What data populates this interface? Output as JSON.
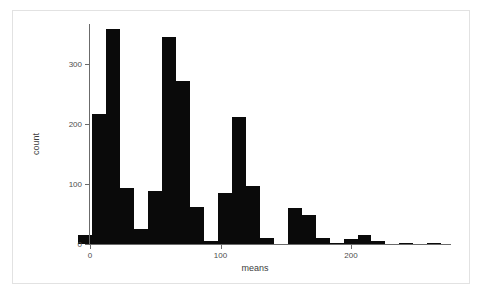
{
  "figure": {
    "background_color": "#ffffff",
    "frame_color": "#e2e2e2",
    "bar_color": "#0a0a0a",
    "axis_color": "#6b6b6b"
  },
  "axes": {
    "x_title": "means",
    "y_title": "count",
    "x_ticks": [
      "0",
      "100",
      "200"
    ],
    "y_ticks": [
      "0",
      "100",
      "200",
      "300"
    ]
  },
  "chart_data": {
    "type": "bar",
    "title": "",
    "subtitle": "",
    "xlabel": "means",
    "ylabel": "count",
    "xlim": [
      -9,
      277
    ],
    "ylim": [
      0,
      368
    ],
    "grid": false,
    "legend": null,
    "bin_width": 10.7,
    "bin_starts": [
      -9.0,
      1.7,
      12.4,
      23.1,
      33.8,
      44.5,
      55.2,
      65.9,
      76.6,
      87.3,
      98.0,
      108.7,
      119.4,
      130.1,
      140.8,
      151.5,
      162.2,
      172.9,
      183.6,
      194.3,
      205.0,
      215.7,
      226.4,
      237.1,
      247.8,
      258.5
    ],
    "categories": [
      "-9",
      "2",
      "12",
      "23",
      "34",
      "45",
      "55",
      "66",
      "77",
      "87",
      "98",
      "109",
      "119",
      "130",
      "141",
      "152",
      "162",
      "173",
      "184",
      "194",
      "205",
      "216",
      "226",
      "237",
      "248",
      "259"
    ],
    "values": [
      15,
      216,
      358,
      93,
      25,
      88,
      345,
      272,
      62,
      5,
      85,
      212,
      96,
      10,
      0,
      60,
      48,
      10,
      2,
      8,
      15,
      5,
      0,
      2,
      0,
      2
    ]
  }
}
